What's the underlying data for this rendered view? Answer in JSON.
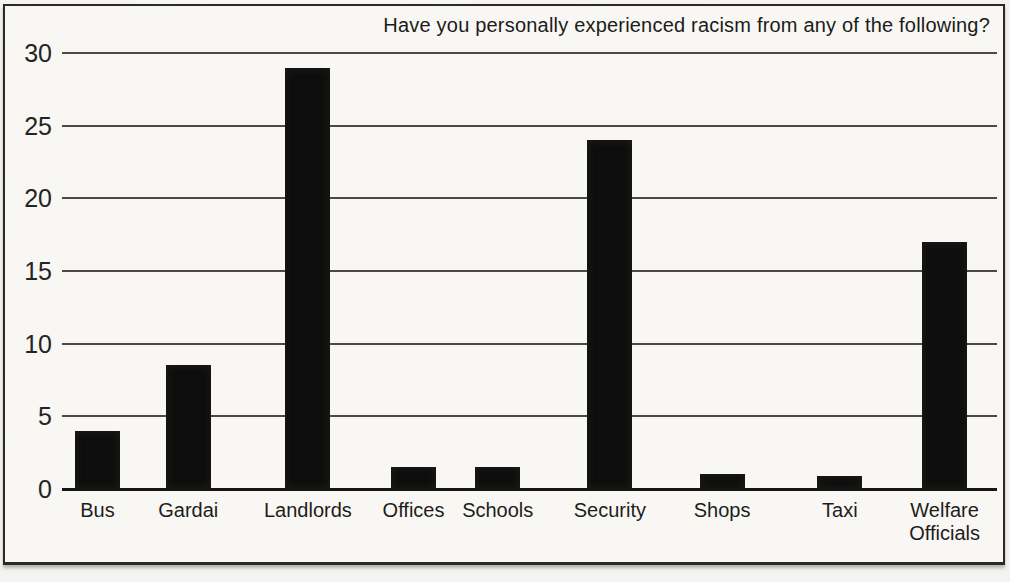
{
  "chart_data": {
    "type": "bar",
    "title": "Have you personally experienced racism from any of the following?",
    "categories": [
      "Bus",
      "Gardai",
      "Landlords",
      "Offices",
      "Schools",
      "Security",
      "Shops",
      "Taxi",
      "Welfare Officials"
    ],
    "values": [
      4,
      8.5,
      29,
      1.5,
      1.5,
      24,
      1,
      0.9,
      17
    ],
    "xlabel": "",
    "ylabel": "",
    "ylim": [
      0,
      30
    ],
    "yticks": [
      0,
      5,
      10,
      15,
      20,
      25,
      30
    ],
    "grid": true,
    "legend_position": "none",
    "bar_color": "#0e0e0e",
    "gridline_color": "#4a4a4a",
    "frame_color": "#2a2a2a",
    "layout_hints": {
      "bar_center_fractions": [
        0.038,
        0.135,
        0.263,
        0.376,
        0.466,
        0.586,
        0.706,
        0.832,
        0.944
      ],
      "bar_width_px": 45
    }
  }
}
